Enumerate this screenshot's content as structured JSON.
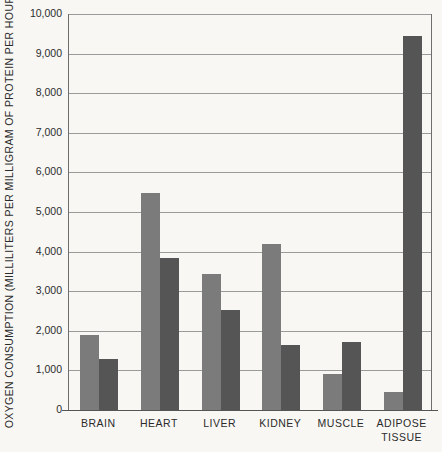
{
  "chart_data": {
    "type": "bar",
    "title": "",
    "xlabel": "",
    "ylabel": "OXYGEN CONSUMPTION (MILLILITERS PER MILLIGRAM OF PROTEIN PER HOUR)",
    "ylim": [
      0,
      10000
    ],
    "ytick_values": [
      0,
      1000,
      2000,
      3000,
      4000,
      5000,
      6000,
      7000,
      8000,
      9000,
      10000
    ],
    "ytick_labels": [
      "0",
      "1,000",
      "2,000",
      "3,000",
      "4,000",
      "5,000",
      "6,000",
      "7,000",
      "8,000",
      "9,000",
      "10,000"
    ],
    "grid": true,
    "legend": "none",
    "categories": [
      "BRAIN",
      "HEART",
      "LIVER",
      "KIDNEY",
      "MUSCLE",
      "ADIPOSE TISSUE"
    ],
    "category_lines": [
      [
        "BRAIN"
      ],
      [
        "HEART"
      ],
      [
        "LIVER"
      ],
      [
        "KIDNEY"
      ],
      [
        "MUSCLE"
      ],
      [
        "ADIPOSE",
        "TISSUE"
      ]
    ],
    "series": [
      {
        "name": "light",
        "color": "#7b7b7b",
        "values": [
          1890,
          5490,
          3440,
          4190,
          910,
          450
        ]
      },
      {
        "name": "dark",
        "color": "#555555",
        "values": [
          1300,
          3830,
          2520,
          1640,
          1720,
          9440
        ]
      }
    ]
  },
  "colors": {
    "background": "#f8f7f4",
    "axis": "#6e6e6e",
    "grid": "#9a9a9a",
    "text": "#2b2b2b",
    "bar_light": "#7b7b7b",
    "bar_dark": "#555555"
  }
}
